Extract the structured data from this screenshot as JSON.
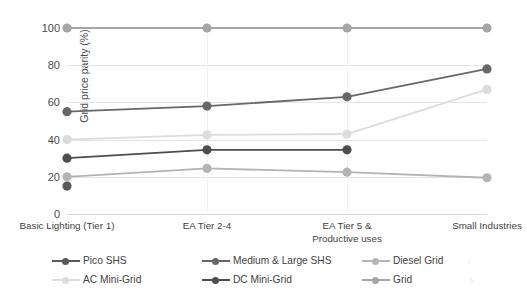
{
  "chart_data": {
    "type": "line",
    "title": "",
    "xlabel": "",
    "ylabel": "Grid price parity (%)",
    "categories": [
      "Basic Lighting (Tier 1)",
      "EA Tier 2-4",
      "EA Tier 5 &\nProductive uses",
      "Small Industries"
    ],
    "ylim": [
      0,
      100
    ],
    "yticks": [
      0,
      20,
      40,
      60,
      80,
      100
    ],
    "grid": true,
    "legend_position": "bottom",
    "series": [
      {
        "name": "Pico SHS",
        "color": "#595959",
        "values": [
          15,
          null,
          null,
          null
        ]
      },
      {
        "name": "Medium & Large SHS",
        "color": "#686868",
        "values": [
          55,
          58,
          63,
          78
        ]
      },
      {
        "name": "Diesel Grid",
        "color": "#b4b4b4",
        "values": [
          20,
          24.5,
          22.5,
          19.5
        ]
      },
      {
        "name": "AC Mini-Grid",
        "color": "#dcdcdc",
        "values": [
          40,
          42.5,
          43,
          67
        ]
      },
      {
        "name": "DC Mini-Grid",
        "color": "#4d4d4d",
        "values": [
          30,
          34.5,
          34.5,
          null
        ]
      },
      {
        "name": "Grid",
        "color": "#a6a6a6",
        "values": [
          100,
          100,
          100,
          100
        ]
      }
    ]
  },
  "axis": {
    "y_title": "Grid price parity (%)",
    "y_ticks": [
      "100",
      "80",
      "60",
      "40",
      "20",
      "0"
    ],
    "x_labels": [
      "Basic Lighting (Tier 1)",
      "EA Tier 2-4",
      "EA Tier 5 &\nProductive uses",
      "Small Industries"
    ]
  },
  "legend": {
    "items": [
      {
        "label": "Pico SHS",
        "color": "#595959"
      },
      {
        "label": "Medium & Large SHS",
        "color": "#686868"
      },
      {
        "label": "Diesel Grid",
        "color": "#b4b4b4"
      },
      {
        "label": "AC Mini-Grid",
        "color": "#dcdcdc"
      },
      {
        "label": "DC Mini-Grid",
        "color": "#4d4d4d"
      },
      {
        "label": "Grid",
        "color": "#a6a6a6"
      }
    ]
  }
}
